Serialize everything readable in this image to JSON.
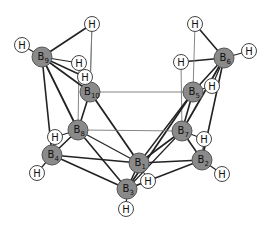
{
  "colors": {
    "boron_fill": "#8a8a8a",
    "boron_stroke": "#555555",
    "hydrogen_fill": "#ffffff",
    "hydrogen_stroke": "#444444",
    "bond": "#222222",
    "thin_bond": "#777777",
    "text": "#111111"
  },
  "atoms": [
    {
      "id": "B1",
      "element": "B",
      "sub": "1",
      "x": 139,
      "y": 163
    },
    {
      "id": "B2",
      "element": "B",
      "sub": "2",
      "x": 202,
      "y": 160
    },
    {
      "id": "B3",
      "element": "B",
      "sub": "3",
      "x": 127,
      "y": 189
    },
    {
      "id": "B4",
      "element": "B",
      "sub": "4",
      "x": 52,
      "y": 155
    },
    {
      "id": "B5",
      "element": "B",
      "sub": "5",
      "x": 193,
      "y": 92
    },
    {
      "id": "B6",
      "element": "B",
      "sub": "6",
      "x": 224,
      "y": 58
    },
    {
      "id": "B7",
      "element": "B",
      "sub": "7",
      "x": 182,
      "y": 131
    },
    {
      "id": "B8",
      "element": "B",
      "sub": "8",
      "x": 78,
      "y": 130
    },
    {
      "id": "B9",
      "element": "B",
      "sub": "9",
      "x": 42,
      "y": 57
    },
    {
      "id": "B10",
      "element": "B",
      "sub": "10",
      "x": 90,
      "y": 92
    },
    {
      "id": "H9a",
      "element": "H",
      "sub": "",
      "x": 22,
      "y": 45
    },
    {
      "id": "H9b",
      "element": "H",
      "sub": "",
      "x": 92,
      "y": 24
    },
    {
      "id": "H9c",
      "element": "H",
      "sub": "",
      "x": 79,
      "y": 63
    },
    {
      "id": "H10",
      "element": "H",
      "sub": "",
      "x": 85,
      "y": 77
    },
    {
      "id": "H6a",
      "element": "H",
      "sub": "",
      "x": 195,
      "y": 24
    },
    {
      "id": "H6b",
      "element": "H",
      "sub": "",
      "x": 249,
      "y": 51
    },
    {
      "id": "H6c",
      "element": "H",
      "sub": "",
      "x": 181,
      "y": 62
    },
    {
      "id": "H5",
      "element": "H",
      "sub": "",
      "x": 212,
      "y": 86
    },
    {
      "id": "H8",
      "element": "H",
      "sub": "",
      "x": 55,
      "y": 137
    },
    {
      "id": "H4",
      "element": "H",
      "sub": "",
      "x": 37,
      "y": 173
    },
    {
      "id": "H7",
      "element": "H",
      "sub": "",
      "x": 204,
      "y": 139
    },
    {
      "id": "H2",
      "element": "H",
      "sub": "",
      "x": 222,
      "y": 174
    },
    {
      "id": "H1",
      "element": "H",
      "sub": "",
      "x": 148,
      "y": 181
    },
    {
      "id": "H3",
      "element": "H",
      "sub": "",
      "x": 126,
      "y": 209
    }
  ],
  "bonds": [
    {
      "a": "B9",
      "b": "H9a",
      "w": 1.2
    },
    {
      "a": "B9",
      "b": "H9b",
      "w": 1.6
    },
    {
      "a": "B9",
      "b": "H9c",
      "w": 1.2
    },
    {
      "a": "B9",
      "b": "H10",
      "w": 1.4
    },
    {
      "a": "H9b",
      "b": "B10",
      "w": 0.9,
      "thin": true
    },
    {
      "a": "H9c",
      "b": "B8",
      "w": 0.9,
      "thin": true
    },
    {
      "a": "H10",
      "b": "B10",
      "w": 1.2
    },
    {
      "a": "B9",
      "b": "B10",
      "w": 1.6
    },
    {
      "a": "B9",
      "b": "B8",
      "w": 1.8
    },
    {
      "a": "B9",
      "b": "B4",
      "w": 1.6
    },
    {
      "a": "B10",
      "b": "B8",
      "w": 1.6
    },
    {
      "a": "B10",
      "b": "B1",
      "w": 1.8
    },
    {
      "a": "B10",
      "b": "B5",
      "w": 0.9,
      "thin": true
    },
    {
      "a": "B6",
      "b": "H6a",
      "w": 1.6
    },
    {
      "a": "B6",
      "b": "H6b",
      "w": 1.2
    },
    {
      "a": "B6",
      "b": "H6c",
      "w": 1.4
    },
    {
      "a": "H6a",
      "b": "B5",
      "w": 0.9,
      "thin": true
    },
    {
      "a": "H6c",
      "b": "B7",
      "w": 0.9,
      "thin": true
    },
    {
      "a": "B5",
      "b": "H5",
      "w": 1.2
    },
    {
      "a": "B6",
      "b": "H5",
      "w": 1.2
    },
    {
      "a": "B6",
      "b": "B5",
      "w": 1.6
    },
    {
      "a": "B6",
      "b": "B7",
      "w": 1.8
    },
    {
      "a": "B6",
      "b": "B2",
      "w": 1.6
    },
    {
      "a": "B5",
      "b": "B7",
      "w": 1.6
    },
    {
      "a": "B5",
      "b": "B3",
      "w": 1.8
    },
    {
      "a": "B5",
      "b": "B1",
      "w": 1.4
    },
    {
      "a": "B8",
      "b": "H8",
      "w": 1.2
    },
    {
      "a": "B4",
      "b": "H8",
      "w": 1.2
    },
    {
      "a": "B8",
      "b": "B4",
      "w": 1.6
    },
    {
      "a": "B8",
      "b": "B7",
      "w": 0.9,
      "thin": true
    },
    {
      "a": "B8",
      "b": "B3",
      "w": 1.6
    },
    {
      "a": "B8",
      "b": "B1",
      "w": 1.2
    },
    {
      "a": "B4",
      "b": "H4",
      "w": 1.2
    },
    {
      "a": "B4",
      "b": "B1",
      "w": 1.4
    },
    {
      "a": "B4",
      "b": "B3",
      "w": 1.6
    },
    {
      "a": "B7",
      "b": "H7",
      "w": 1.2
    },
    {
      "a": "B2",
      "b": "H7",
      "w": 1.2
    },
    {
      "a": "B7",
      "b": "B2",
      "w": 1.6
    },
    {
      "a": "B7",
      "b": "B1",
      "w": 1.6
    },
    {
      "a": "B7",
      "b": "B3",
      "w": 1.2
    },
    {
      "a": "B2",
      "b": "H2",
      "w": 1.2
    },
    {
      "a": "B2",
      "b": "B1",
      "w": 1.6
    },
    {
      "a": "B2",
      "b": "B3",
      "w": 1.4
    },
    {
      "a": "B1",
      "b": "B3",
      "w": 1.6
    },
    {
      "a": "B1",
      "b": "H1",
      "w": 1.0
    },
    {
      "a": "B3",
      "b": "H1",
      "w": 1.0
    },
    {
      "a": "B3",
      "b": "H3",
      "w": 1.2
    },
    {
      "a": "H9b",
      "b": "B10",
      "w": 0.9,
      "thin": true
    }
  ]
}
